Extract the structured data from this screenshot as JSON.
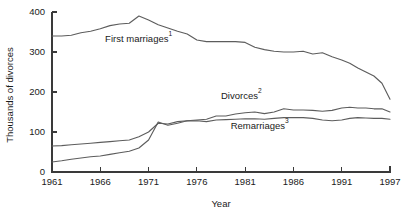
{
  "chart_data": {
    "type": "line",
    "title": "",
    "xlabel": "Year",
    "ylabel": "Thousands of divorces",
    "xlim": [
      1961,
      1997
    ],
    "ylim": [
      0,
      400
    ],
    "xticks": [
      1961,
      1966,
      1971,
      1976,
      1981,
      1986,
      1991,
      1997
    ],
    "xticklabels": [
      "1961",
      "1966",
      "1971",
      "1976",
      "1981",
      "1986",
      "1991",
      "1997"
    ],
    "yticks": [
      0,
      100,
      200,
      300,
      400
    ],
    "yticklabels": [
      "0",
      "100",
      "200",
      "300",
      "400"
    ],
    "grid": false,
    "legend": "inline-annotations",
    "line_color": "#5d5d5d",
    "axis_color": "#3a3a3a",
    "background": "#ffffff",
    "x": [
      1961,
      1962,
      1963,
      1964,
      1965,
      1966,
      1967,
      1968,
      1969,
      1970,
      1971,
      1972,
      1973,
      1974,
      1975,
      1976,
      1977,
      1978,
      1979,
      1980,
      1981,
      1982,
      1983,
      1984,
      1985,
      1986,
      1987,
      1988,
      1989,
      1990,
      1991,
      1992,
      1993,
      1994,
      1995,
      1996,
      1997
    ],
    "series": [
      {
        "name": "First marriages",
        "footnote": "1",
        "label_text": "First marriages",
        "label_superscript": "1",
        "values": [
          340,
          340,
          342,
          348,
          352,
          358,
          366,
          370,
          372,
          390,
          380,
          368,
          360,
          352,
          345,
          330,
          326,
          326,
          326,
          326,
          324,
          312,
          306,
          302,
          300,
          300,
          302,
          295,
          298,
          288,
          280,
          272,
          260,
          250,
          240,
          222,
          182
        ]
      },
      {
        "name": "Divorces",
        "footnote": "2",
        "label_text": "Divorces",
        "label_superscript": "2",
        "values": [
          25,
          28,
          32,
          35,
          38,
          40,
          44,
          48,
          52,
          60,
          80,
          125,
          117,
          122,
          128,
          130,
          132,
          140,
          140,
          145,
          148,
          150,
          146,
          150,
          158,
          155,
          155,
          154,
          152,
          154,
          160,
          162,
          160,
          160,
          158,
          158,
          150
        ]
      },
      {
        "name": "Remarriages",
        "footnote": "3",
        "label_text": "Remarriages",
        "label_superscript": "3",
        "values": [
          65,
          66,
          68,
          70,
          72,
          74,
          76,
          78,
          80,
          88,
          100,
          122,
          120,
          126,
          128,
          128,
          126,
          130,
          131,
          132,
          133,
          133,
          132,
          134,
          136,
          136,
          136,
          134,
          130,
          128,
          130,
          134,
          136,
          135,
          134,
          134,
          132
        ]
      }
    ],
    "annotations": [
      {
        "text": "First marriages",
        "sup": "1",
        "x": 1966.5,
        "y": 325
      },
      {
        "text": "Divorces",
        "sup": "2",
        "x": 1978.5,
        "y": 182
      },
      {
        "text": "Remarriages",
        "sup": "3",
        "x": 1979.5,
        "y": 108
      }
    ]
  }
}
